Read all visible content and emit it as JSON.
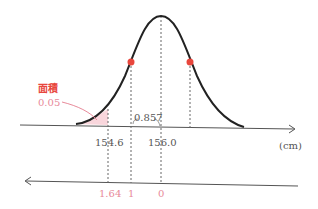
{
  "diagram": {
    "type": "normal-distribution",
    "annotation": {
      "title": "面積",
      "value": "0.05"
    },
    "upper_axis": {
      "unit": "(cm)",
      "ticks": [
        {
          "label": "154.6"
        },
        {
          "label": "156.0"
        }
      ],
      "gap_label": "0.857"
    },
    "lower_axis": {
      "ticks": [
        {
          "label": "1.64"
        },
        {
          "label": "1"
        },
        {
          "label": "0"
        }
      ]
    },
    "colors": {
      "curve": "#222222",
      "axis": "#555555",
      "accent": "#e8463c",
      "pink": "#e88a9a",
      "shade": "#f9d6dc"
    }
  }
}
